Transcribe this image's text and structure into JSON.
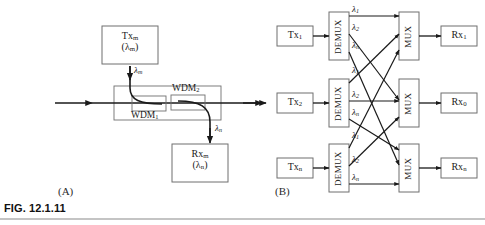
{
  "figure": {
    "caption": "FIG. 12.1.11",
    "rule_color": "#8a8a8a",
    "line_color": "#1a1a1a",
    "box_border_color": "#6f6f6f",
    "text_color": "#1a1a1a"
  },
  "panel_a": {
    "label": "(A)",
    "tx_box": {
      "line1": "Tx",
      "sub1": "m",
      "line2": "(λ",
      "sub2": "m",
      "line2_close": ")"
    },
    "rx_box": {
      "line1": "Rx",
      "sub1": "m",
      "line2": "(λ",
      "sub2": "n",
      "line2_close": ")"
    },
    "wdm1": {
      "name": "WDM",
      "sub": "1"
    },
    "wdm2": {
      "name": "WDM",
      "sub": "2"
    },
    "add_lambda": {
      "symbol": "λ",
      "sub": "m"
    },
    "drop_lambda": {
      "symbol": "λ",
      "sub": "n"
    }
  },
  "panel_b": {
    "label": "(B)",
    "demux_label": "DEMUX",
    "mux_label": "MUX",
    "tx_nodes": [
      {
        "name": "Tx",
        "sub": "1"
      },
      {
        "name": "Tx",
        "sub": "2"
      },
      {
        "name": "Tx",
        "sub": "n"
      }
    ],
    "rx_nodes": [
      {
        "name": "Rx",
        "sub": "1"
      },
      {
        "name": "Rx",
        "sub": "0"
      },
      {
        "name": "Rx",
        "sub": "n"
      }
    ],
    "wavelength_groups": [
      [
        {
          "symbol": "λ",
          "sub": "1"
        },
        {
          "symbol": "λ",
          "sub": "2"
        },
        {
          "symbol": "λ",
          "sub": "n"
        }
      ],
      [
        {
          "symbol": "λ",
          "sub": "1"
        },
        {
          "symbol": "λ",
          "sub": "2"
        },
        {
          "symbol": "λ",
          "sub": "n"
        }
      ],
      [
        {
          "symbol": "λ",
          "sub": "1"
        },
        {
          "symbol": "λ",
          "sub": "2"
        },
        {
          "symbol": "λ",
          "sub": "n"
        }
      ]
    ]
  }
}
